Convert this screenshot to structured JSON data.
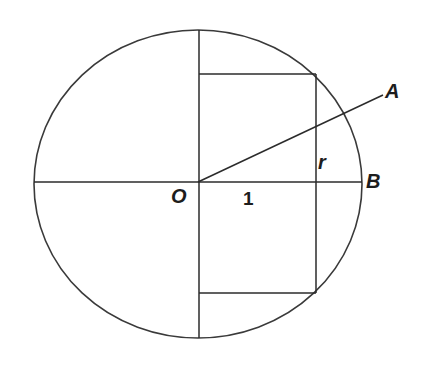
{
  "figure": {
    "name": "circle-with-inscribed-rectangle-and-radius",
    "background_color": "#ffffff",
    "stroke_color": "#2b2b2b",
    "labels": {
      "center": "O",
      "unit_segment": "1",
      "short_side": "r",
      "point_a": "A",
      "point_b": "B"
    }
  },
  "chart_data": {
    "type": "diagram",
    "title": "",
    "xlabel": "",
    "ylabel": "",
    "canvas": {
      "width": 424,
      "height": 366
    },
    "circle": {
      "name": "main-circle",
      "center": {
        "x": 198,
        "y": 184
      },
      "radius_x": 164,
      "radius_y": 154
    },
    "points": [
      {
        "name": "O",
        "label": "O",
        "x": 198,
        "y": 182,
        "role": "center"
      },
      {
        "name": "A",
        "label": "A",
        "x": 383,
        "y": 95,
        "role": "radius-endpoint-outside"
      },
      {
        "name": "B",
        "label": "B",
        "x": 362,
        "y": 182,
        "role": "circle-right-intersection"
      }
    ],
    "segments": [
      {
        "name": "horizontal-diameter",
        "x1": 34,
        "y1": 182,
        "x2": 362,
        "y2": 182
      },
      {
        "name": "vertical-diameter",
        "x1": 199,
        "y1": 30,
        "x2": 199,
        "y2": 338
      },
      {
        "name": "radius-OA",
        "x1": 198,
        "y1": 182,
        "x2": 383,
        "y2": 95
      },
      {
        "name": "rectangle-top-edge",
        "x1": 199,
        "y1": 74,
        "x2": 316,
        "y2": 74
      },
      {
        "name": "rectangle-bottom-edge",
        "x1": 199,
        "y1": 293,
        "x2": 316,
        "y2": 293
      },
      {
        "name": "rectangle-right-edge",
        "x1": 316,
        "y1": 74,
        "x2": 316,
        "y2": 293
      }
    ],
    "rectangle": {
      "name": "inscribed-rectangle",
      "left": 199,
      "top": 74,
      "right": 316,
      "bottom": 293,
      "width": 117,
      "height": 219,
      "half_width_label": "1",
      "half_height_label": "r"
    },
    "annotations": [
      {
        "name": "label-O",
        "text": "O",
        "x": 178,
        "y": 196,
        "style": "italic-bold"
      },
      {
        "name": "label-1",
        "text": "1",
        "x": 250,
        "y": 198,
        "style": "plain-bold"
      },
      {
        "name": "label-r",
        "text": "r",
        "x": 322,
        "y": 161,
        "style": "italic-bold"
      },
      {
        "name": "label-A",
        "text": "A",
        "x": 393,
        "y": 91,
        "style": "italic-bold"
      },
      {
        "name": "label-B",
        "text": "B",
        "x": 373,
        "y": 181,
        "style": "italic-bold"
      }
    ]
  }
}
